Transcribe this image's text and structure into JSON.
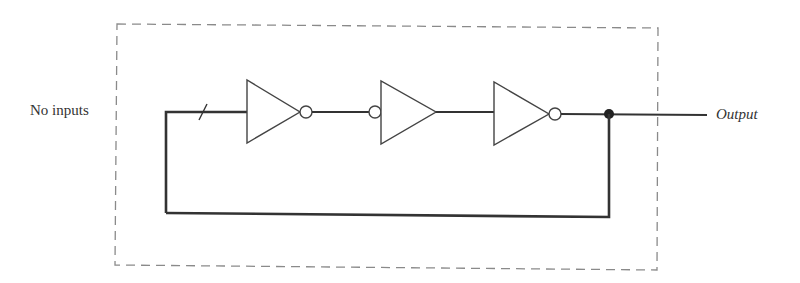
{
  "diagram": {
    "labels": {
      "left": "No inputs",
      "right": "Output"
    },
    "components": [
      {
        "type": "inverter",
        "bubble": "output"
      },
      {
        "type": "inverter",
        "bubble": "input"
      },
      {
        "type": "inverter",
        "bubble": "output"
      }
    ],
    "connections": [
      "feedback wire from output node back to first inverter input",
      "junction dot at output node",
      "slash mark on input wire"
    ],
    "boundary": "dashed box",
    "colors": {
      "line": "#333333",
      "dash": "#888888",
      "text": "#333333"
    }
  }
}
